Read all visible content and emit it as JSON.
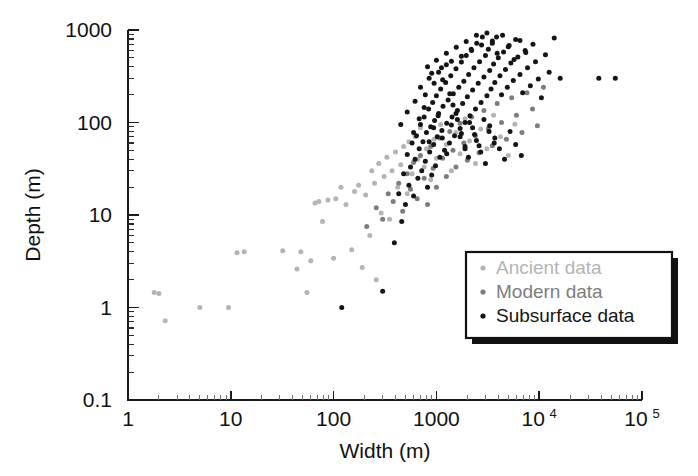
{
  "figure": {
    "name": "width-depth-scatter",
    "background": "#ffffff"
  },
  "axes": {
    "x": {
      "title": "Width (m)",
      "scale": "log",
      "min": 1,
      "max": 100000,
      "tick_labels": [
        "1",
        "10",
        "100",
        "1000",
        "10",
        "10"
      ],
      "tick_values": [
        1,
        10,
        100,
        1000,
        10000,
        100000
      ],
      "tick_label_main": [
        "1",
        "10",
        "100",
        "1000",
        "10",
        "10"
      ],
      "tick_label_exp": [
        "",
        "",
        "",
        "",
        "4",
        "5"
      ]
    },
    "y": {
      "title": "Depth (m)",
      "scale": "log",
      "min": 0.1,
      "max": 1000,
      "tick_labels": [
        "1000",
        "100",
        "10",
        "1",
        "0.1"
      ],
      "tick_values": [
        1000,
        100,
        10,
        1,
        0.1
      ]
    }
  },
  "legend": {
    "name": "data-series-legend",
    "position": "lower-right",
    "items": [
      {
        "label": "Ancient data",
        "color": "#b4b4b4"
      },
      {
        "label": "Modern data",
        "color": "#7d7d7d"
      },
      {
        "label": "Subsurface data",
        "color": "#151515"
      }
    ]
  },
  "chart_data": {
    "type": "scatter",
    "title": "",
    "xlabel": "Width (m)",
    "ylabel": "Depth (m)",
    "xscale": "log",
    "yscale": "log",
    "xlim": [
      1,
      100000
    ],
    "ylim": [
      0.1,
      1000
    ],
    "grid": false,
    "legend_position": "lower-right",
    "series": [
      {
        "name": "Ancient data",
        "color": "#b4b4b4",
        "points": [
          [
            1.8,
            1.45
          ],
          [
            2.0,
            1.42
          ],
          [
            2.3,
            0.72
          ],
          [
            5.0,
            1.0
          ],
          [
            9.5,
            1.0
          ],
          [
            11.5,
            3.9
          ],
          [
            13.5,
            4.0
          ],
          [
            32,
            4.1
          ],
          [
            44,
            2.6
          ],
          [
            48,
            4.0
          ],
          [
            55,
            1.45
          ],
          [
            60,
            3.2
          ],
          [
            66,
            13.5
          ],
          [
            72,
            14.0
          ],
          [
            78,
            8.5
          ],
          [
            88,
            14.5
          ],
          [
            100,
            3.4
          ],
          [
            105,
            15.0
          ],
          [
            118,
            20.0
          ],
          [
            132,
            13.0
          ],
          [
            150,
            4.2
          ],
          [
            160,
            18.0
          ],
          [
            175,
            21.0
          ],
          [
            190,
            2.7
          ],
          [
            205,
            16.5
          ],
          [
            225,
            6.0
          ],
          [
            235,
            30.0
          ],
          [
            250,
            22.0
          ],
          [
            260,
            2.0
          ],
          [
            275,
            36.0
          ],
          [
            290,
            10.5
          ],
          [
            310,
            26.0
          ],
          [
            330,
            42.0
          ],
          [
            350,
            9.0
          ],
          [
            370,
            30.0
          ],
          [
            400,
            48.0
          ],
          [
            420,
            20.0
          ],
          [
            450,
            35.0
          ],
          [
            480,
            55.0
          ],
          [
            520,
            17.0
          ],
          [
            540,
            62.0
          ],
          [
            580,
            28.0
          ],
          [
            620,
            70.0
          ],
          [
            660,
            40.0
          ],
          [
            700,
            88.0
          ],
          [
            760,
            33.0
          ],
          [
            800,
            52.0
          ],
          [
            880,
            24.0
          ],
          [
            950,
            66.0
          ],
          [
            1000,
            41.0
          ],
          [
            1100,
            95.0
          ],
          [
            1250,
            58.0
          ],
          [
            1400,
            30.0
          ],
          [
            1550,
            78.0
          ],
          [
            1700,
            46.0
          ],
          [
            1900,
            110.0
          ],
          [
            2100,
            63.0
          ],
          [
            2400,
            36.0
          ],
          [
            2700,
            85.0
          ],
          [
            3100,
            52.0
          ],
          [
            3600,
            120.0
          ],
          [
            4200,
            70.0
          ],
          [
            5000,
            44.0
          ],
          [
            5800,
            96.0
          ]
        ]
      },
      {
        "name": "Modern data",
        "color": "#7d7d7d",
        "points": [
          [
            210,
            7.5
          ],
          [
            260,
            12.0
          ],
          [
            300,
            9.0
          ],
          [
            340,
            17.0
          ],
          [
            380,
            14.0
          ],
          [
            430,
            22.0
          ],
          [
            470,
            11.0
          ],
          [
            520,
            28.0
          ],
          [
            560,
            19.0
          ],
          [
            600,
            37.0
          ],
          [
            650,
            15.0
          ],
          [
            700,
            44.0
          ],
          [
            760,
            25.0
          ],
          [
            820,
            13.0
          ],
          [
            880,
            55.0
          ],
          [
            930,
            32.0
          ],
          [
            1000,
            20.0
          ],
          [
            1080,
            68.0
          ],
          [
            1150,
            41.0
          ],
          [
            1250,
            26.0
          ],
          [
            1350,
            80.0
          ],
          [
            1450,
            50.0
          ],
          [
            1550,
            33.0
          ],
          [
            1700,
            98.0
          ],
          [
            1850,
            60.0
          ],
          [
            2000,
            39.0
          ],
          [
            2200,
            115.0
          ],
          [
            2400,
            72.0
          ],
          [
            2600,
            47.0
          ],
          [
            2900,
            135.0
          ],
          [
            3200,
            86.0
          ],
          [
            3500,
            56.0
          ],
          [
            3900,
            160.0
          ],
          [
            4300,
            100.0
          ],
          [
            4800,
            66.0
          ],
          [
            5400,
            185.0
          ],
          [
            6000,
            120.0
          ],
          [
            6800,
            78.0
          ],
          [
            7600,
            210.0
          ],
          [
            8600,
            140.0
          ],
          [
            9600,
            92.0
          ],
          [
            11000,
            240.0
          ]
        ]
      },
      {
        "name": "Subsurface data",
        "color": "#151515",
        "points": [
          [
            120,
            1.0
          ],
          [
            300,
            1.5
          ],
          [
            390,
            5.0
          ],
          [
            430,
            17.0
          ],
          [
            460,
            8.5
          ],
          [
            480,
            28.0
          ],
          [
            500,
            13.0
          ],
          [
            520,
            45.0
          ],
          [
            540,
            21.0
          ],
          [
            560,
            33.0
          ],
          [
            580,
            60.0
          ],
          [
            600,
            16.0
          ],
          [
            620,
            40.0
          ],
          [
            640,
            72.0
          ],
          [
            660,
            25.0
          ],
          [
            680,
            52.0
          ],
          [
            700,
            95.0
          ],
          [
            720,
            30.0
          ],
          [
            740,
            62.0
          ],
          [
            760,
            115.0
          ],
          [
            780,
            38.0
          ],
          [
            800,
            78.0
          ],
          [
            820,
            20.0
          ],
          [
            840,
            140.0
          ],
          [
            860,
            48.0
          ],
          [
            880,
            90.0
          ],
          [
            900,
            27.0
          ],
          [
            920,
            165.0
          ],
          [
            940,
            58.0
          ],
          [
            960,
            105.0
          ],
          [
            980,
            34.0
          ],
          [
            1000,
            195.0
          ],
          [
            1020,
            70.0
          ],
          [
            1050,
            125.0
          ],
          [
            1080,
            42.0
          ],
          [
            1100,
            230.0
          ],
          [
            1130,
            82.0
          ],
          [
            1160,
            150.0
          ],
          [
            1200,
            50.0
          ],
          [
            1230,
            270.0
          ],
          [
            1260,
            98.0
          ],
          [
            1300,
            175.0
          ],
          [
            1340,
            60.0
          ],
          [
            1380,
            320.0
          ],
          [
            1420,
            115.0
          ],
          [
            1460,
            205.0
          ],
          [
            1500,
            72.0
          ],
          [
            1550,
            380.0
          ],
          [
            1600,
            135.0
          ],
          [
            1650,
            240.0
          ],
          [
            1700,
            86.0
          ],
          [
            1750,
            450.0
          ],
          [
            1800,
            160.0
          ],
          [
            1850,
            280.0
          ],
          [
            1900,
            100.0
          ],
          [
            1950,
            530.0
          ],
          [
            2000,
            190.0
          ],
          [
            2060,
            330.0
          ],
          [
            2120,
            118.0
          ],
          [
            2180,
            620.0
          ],
          [
            2250,
            225.0
          ],
          [
            2320,
            390.0
          ],
          [
            2400,
            140.0
          ],
          [
            2470,
            720.0
          ],
          [
            2550,
            265.0
          ],
          [
            2630,
            455.0
          ],
          [
            2720,
            165.0
          ],
          [
            2800,
            840.0
          ],
          [
            2900,
            310.0
          ],
          [
            3000,
            530.0
          ],
          [
            3100,
            195.0
          ],
          [
            3200,
            620.0
          ],
          [
            3300,
            365.0
          ],
          [
            3400,
            230.0
          ],
          [
            3500,
            720.0
          ],
          [
            3600,
            430.0
          ],
          [
            3700,
            270.0
          ],
          [
            3850,
            840.0
          ],
          [
            4000,
            500.0
          ],
          [
            4150,
            320.0
          ],
          [
            4300,
            200.0
          ],
          [
            4500,
            580.0
          ],
          [
            4700,
            375.0
          ],
          [
            4900,
            240.0
          ],
          [
            5100,
            680.0
          ],
          [
            5300,
            440.0
          ],
          [
            5600,
            285.0
          ],
          [
            5900,
            790.0
          ],
          [
            6200,
            510.0
          ],
          [
            6500,
            330.0
          ],
          [
            6900,
            210.0
          ],
          [
            7300,
            600.0
          ],
          [
            7700,
            390.0
          ],
          [
            8200,
            250.0
          ],
          [
            8700,
            700.0
          ],
          [
            9200,
            455.0
          ],
          [
            9800,
            295.0
          ],
          [
            10500,
            185.0
          ],
          [
            11500,
            540.0
          ],
          [
            12500,
            350.0
          ],
          [
            14000,
            820.0
          ],
          [
            16000,
            300.0
          ],
          [
            38000,
            300.0
          ],
          [
            55000,
            300.0
          ],
          [
            620,
            170.0
          ],
          [
            700,
            240.0
          ],
          [
            780,
            200.0
          ],
          [
            850,
            300.0
          ],
          [
            950,
            265.0
          ],
          [
            1050,
            350.0
          ],
          [
            1150,
            290.0
          ],
          [
            1250,
            420.0
          ],
          [
            1350,
            205.0
          ],
          [
            1450,
            155.0
          ],
          [
            1600,
            108.0
          ],
          [
            1750,
            76.0
          ],
          [
            1900,
            55.0
          ],
          [
            2050,
            42.0
          ],
          [
            2250,
            88.0
          ],
          [
            2450,
            64.0
          ],
          [
            2700,
            48.0
          ],
          [
            3000,
            36.0
          ],
          [
            3300,
            92.0
          ],
          [
            3700,
            68.0
          ],
          [
            4100,
            52.0
          ],
          [
            4600,
            40.0
          ],
          [
            5200,
            80.0
          ],
          [
            5900,
            58.0
          ],
          [
            6700,
            44.0
          ],
          [
            450,
            95.0
          ],
          [
            520,
            130.0
          ],
          [
            600,
            78.0
          ],
          [
            680,
            110.0
          ],
          [
            760,
            145.0
          ],
          [
            850,
            62.0
          ],
          [
            940,
            88.0
          ],
          [
            1040,
            118.0
          ],
          [
            1140,
            68.0
          ],
          [
            1260,
            46.0
          ],
          [
            1400,
            94.0
          ],
          [
            1550,
            125.0
          ],
          [
            1700,
            70.0
          ],
          [
            1900,
            52.0
          ],
          [
            2100,
            100.0
          ],
          [
            2350,
            74.0
          ],
          [
            2600,
            56.0
          ],
          [
            2900,
            108.0
          ],
          [
            3250,
            80.0
          ],
          [
            3650,
            60.0
          ],
          [
            820,
            400.0
          ],
          [
            900,
            340.0
          ],
          [
            1000,
            470.0
          ],
          [
            1120,
            390.0
          ],
          [
            1250,
            560.0
          ],
          [
            1400,
            460.0
          ],
          [
            1560,
            650.0
          ],
          [
            1750,
            520.0
          ],
          [
            1950,
            750.0
          ],
          [
            2200,
            600.0
          ],
          [
            2450,
            880.0
          ],
          [
            2750,
            690.0
          ],
          [
            3100,
            930.0
          ],
          [
            3500,
            760.0
          ],
          [
            3900,
            560.0
          ],
          [
            4400,
            880.0
          ],
          [
            5000,
            660.0
          ],
          [
            5700,
            480.0
          ],
          [
            6500,
            770.0
          ],
          [
            7400,
            570.0
          ]
        ]
      }
    ]
  }
}
